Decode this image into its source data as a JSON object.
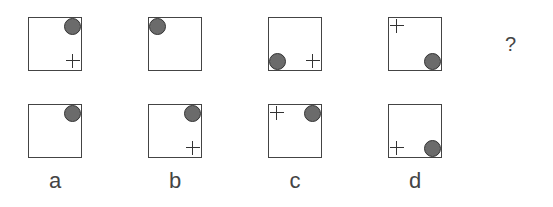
{
  "puzzle": {
    "question_mark": "?",
    "sequence": [
      {
        "id": "s1",
        "circle": "tr",
        "cross": "br"
      },
      {
        "id": "s2",
        "circle": "tl",
        "cross": null
      },
      {
        "id": "s3",
        "circle": "bl",
        "cross": "br"
      },
      {
        "id": "s4",
        "circle": "br",
        "cross": "tl"
      }
    ],
    "options": [
      {
        "label": "a",
        "circle": "tr",
        "cross": null
      },
      {
        "label": "b",
        "circle": "tr",
        "cross": "br"
      },
      {
        "label": "c",
        "circle": "tr",
        "cross": "tl"
      },
      {
        "label": "d",
        "circle": "br",
        "cross": "bl"
      }
    ],
    "colors": {
      "circle_fill": "#6b6b6b",
      "stroke": "#444444"
    }
  }
}
